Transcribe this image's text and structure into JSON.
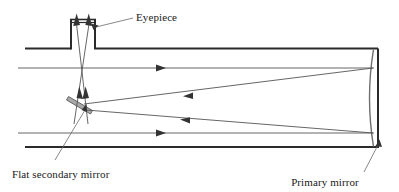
{
  "figure": {
    "background_color": "#ffffff",
    "width": 399,
    "height": 192
  },
  "labels": {
    "eyepiece": "Eyepiece",
    "flat_secondary_mirror": "Flat secondary mirror",
    "primary_mirror": "Primary mirror"
  },
  "colors": {
    "tube_wall": "#2b2b2b",
    "ray": "#555555",
    "mirror_primary": "#6f6f6f",
    "mirror_secondary_fill": "#a8a8a8",
    "mirror_secondary_stroke": "#5a5a5a",
    "leader_line": "#6a6a6a",
    "text": "#1a1a1a"
  },
  "parts": {
    "telescope_tube": "telescope-tube",
    "eyepiece_tube": "eyepiece-tube",
    "primary_mirror_curve": "primary-mirror-curve",
    "secondary_mirror_bar": "flat-secondary-mirror-bar",
    "incoming_ray_upper": "incoming-light-ray-upper",
    "incoming_ray_lower": "incoming-light-ray-lower",
    "reflected_ray_upper": "reflected-converging-ray-upper",
    "reflected_ray_lower": "reflected-converging-ray-lower",
    "eyepiece_ray_left": "eyepiece-exit-ray-left",
    "eyepiece_ray_right": "eyepiece-exit-ray-right"
  }
}
